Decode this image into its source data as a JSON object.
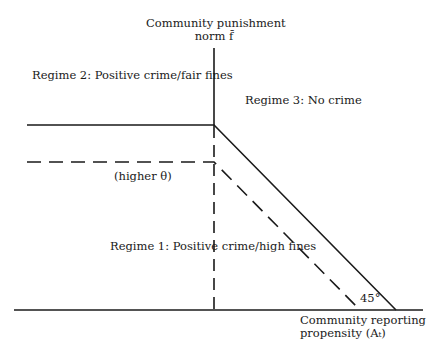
{
  "diagram": {
    "y_axis_label": [
      "Community punishment",
      "norm f̄"
    ],
    "x_axis_label": [
      "Community reporting",
      "propensity (Aₜ)"
    ],
    "regions": {
      "regime2": "Regime 2: Positive crime/fair fines",
      "regime3": "Regime 3: No crime",
      "regime1": "Regime 1: Positive crime/high fines"
    },
    "annotations": {
      "higher_theta": "(higher θ)",
      "angle": "45°"
    },
    "curves": [
      {
        "name": "baseline-boundary",
        "style": "solid"
      },
      {
        "name": "higher-theta-boundary",
        "style": "dashed"
      }
    ],
    "colors": {
      "line": "#1a1a1a",
      "background": "#ffffff"
    }
  }
}
